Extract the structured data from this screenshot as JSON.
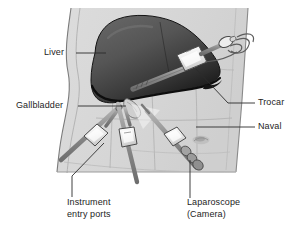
{
  "figure": {
    "background_color": "#ffffff",
    "body_fill": "#d8d8d8",
    "body_outline": "#6a6a6a",
    "liver_fill_dark": "#3a3a3a",
    "liver_fill_light": "#8a8a8a",
    "liver_edge": "#111111",
    "instrument_fill": "#f2f2f2",
    "instrument_outline": "#4a4a4a",
    "shaft_fill": "#9a9a9a",
    "leader_color": "#3a3a3a",
    "text_color": "#1d1d1d"
  },
  "labels": {
    "liver": "Liver",
    "gallbladder": "Gallbladder",
    "trocar": "Trocar",
    "naval": "Naval",
    "instrument_entry_ports_line1": "Instrument",
    "instrument_entry_ports_line2": "entry ports",
    "laparoscope_line1": "Laparoscope",
    "laparoscope_line2": "(Camera)"
  },
  "anatomy": [
    {
      "name": "torso",
      "description": "Patient abdomen shown in light gray"
    },
    {
      "name": "liver",
      "description": "Large dark organ in upper abdomen"
    },
    {
      "name": "gallbladder",
      "description": "Small organ beneath the liver edge"
    },
    {
      "name": "naval",
      "description": "Umbilicus marking on abdomen"
    }
  ],
  "instruments": [
    {
      "name": "trocar-upper-right",
      "description": "Trocar with insufflation tubing entering upper right abdomen"
    },
    {
      "name": "instrument-port-left",
      "description": "Instrument entry port on left side"
    },
    {
      "name": "instrument-port-center",
      "description": "Instrument entry port in center"
    },
    {
      "name": "laparoscope",
      "description": "Laparoscope camera with eyepiece"
    }
  ]
}
